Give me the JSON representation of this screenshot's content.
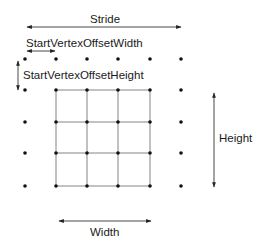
{
  "labels": {
    "stride": "Stride",
    "start_vertex_offset_width": "StartVertexOffsetWidth",
    "start_vertex_offset_height": "StartVertexOffsetHeight",
    "height": "Height",
    "width": "Width"
  },
  "grid": {
    "columns_x": [
      25,
      56,
      87,
      118,
      150,
      181
    ],
    "rows_y": [
      59,
      90,
      122,
      153,
      186
    ],
    "mesh_columns": [
      1,
      2,
      3,
      4
    ],
    "mesh_rows": [
      1,
      2,
      3,
      4
    ]
  },
  "colors": {
    "dot": "#111111",
    "line": "#555555",
    "text": "#1a1a1a"
  }
}
